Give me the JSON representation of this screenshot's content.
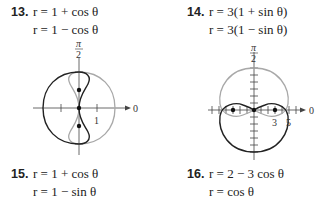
{
  "problems": [
    {
      "number": "13.",
      "eq1": "r = 1 + cos θ",
      "eq2": "r = 1 − cos θ"
    },
    {
      "number": "14.",
      "eq1": "r = 3(1 + sin θ)",
      "eq2": "r = 3(1 − sin θ)"
    },
    {
      "number": "15.",
      "eq1": "r = 1 + cos θ",
      "eq2": "r = 1 − sin θ"
    },
    {
      "number": "16.",
      "eq1": "r = 2 − 3 cos θ",
      "eq2": "r = cos θ"
    }
  ],
  "graphs": [
    {
      "id": "graph-13",
      "polar_axis_label": "0",
      "pi_over_2_num": "π",
      "pi_over_2_den": "2",
      "tick_label": "1",
      "curves": [
        {
          "eq": "r = 1 + cos θ",
          "color": "#a0a0a0"
        },
        {
          "eq": "r = 1 − cos θ",
          "color": "#222222"
        }
      ]
    },
    {
      "id": "graph-14",
      "polar_axis_label": "0",
      "pi_over_2_num": "π",
      "pi_over_2_den": "2",
      "tick_labels": [
        "3",
        "5"
      ],
      "curves": [
        {
          "eq": "r = 3(1 + sin θ)",
          "color": "#a0a0a0"
        },
        {
          "eq": "r = 3(1 − sin θ)",
          "color": "#222222"
        }
      ]
    }
  ]
}
